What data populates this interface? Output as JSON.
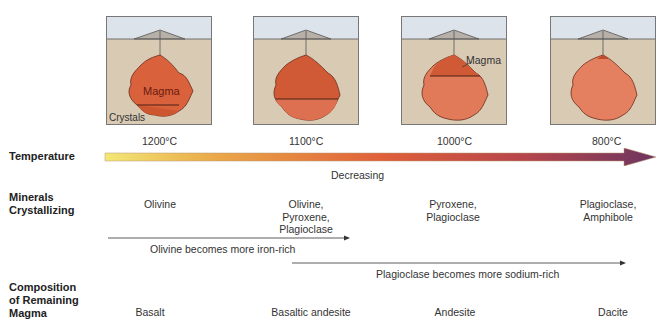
{
  "panels": [
    {
      "magma_label": "Magma",
      "crystals_label": "Crystals"
    },
    {},
    {
      "magma_label": "Magma"
    },
    {}
  ],
  "row_labels": {
    "temperature": "Temperature",
    "minerals": [
      "Minerals",
      "Crystallizing"
    ],
    "composition": [
      "Composition",
      "of Remaining",
      "Magma"
    ]
  },
  "temperatures": [
    "1200°C",
    "1100°C",
    "1000°C",
    "800°C"
  ],
  "temperature_arrow": {
    "label": "Decreasing",
    "start_color": "#f0e060",
    "mid_color": "#e0603a",
    "end_color": "#6e3560"
  },
  "minerals": [
    [
      "Olivine"
    ],
    [
      "Olivine,",
      "Pyroxene,",
      "Plagioclase"
    ],
    [
      "Pyroxene,",
      "Plagioclase"
    ],
    [
      "Plagioclase,",
      "Amphibole"
    ]
  ],
  "trends": [
    {
      "label": "Olivine becomes more iron-rich"
    },
    {
      "label": "Plagioclase becomes more sodium-rich"
    }
  ],
  "compositions": [
    "Basalt",
    "Basaltic andesite",
    "Andesite",
    "Dacite"
  ]
}
